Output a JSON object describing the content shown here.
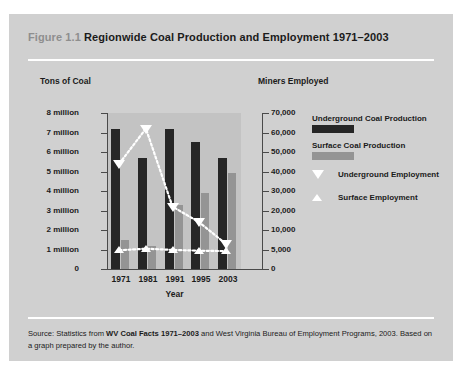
{
  "figure": {
    "label": "Figure 1.1",
    "title": "Regionwide Coal Production and Employment 1971–2003"
  },
  "source": {
    "prefix": "Source: Statistics from ",
    "emphasis": "WV Coal Facts 1971–2003",
    "suffix": " and West Virginia Bureau of Employment Programs, 2003. Based on a graph prepared by the author."
  },
  "colors": {
    "card_background": "#d0d0d0",
    "plot_background": "#c3c3c3",
    "underground_bar": "#262626",
    "surface_bar": "#949494",
    "marker": "#ffffff",
    "axis": "#4a4a4a",
    "rule": "#ffffff",
    "text": "#1b1b1b",
    "label_gray": "#8e8e8e"
  },
  "legend": {
    "items": [
      {
        "name": "underground-coal-production",
        "label": "Underground Coal Production",
        "kind": "swatch",
        "color": "#262626"
      },
      {
        "name": "surface-coal-production",
        "label": "Surface Coal Production",
        "kind": "swatch",
        "color": "#949494"
      },
      {
        "name": "underground-employment",
        "label": "Underground Employment",
        "kind": "marker-down",
        "color": "#ffffff"
      },
      {
        "name": "surface-employment",
        "label": "Surface Employment",
        "kind": "marker-up",
        "color": "#ffffff"
      }
    ]
  },
  "chart_data": {
    "type": "bar",
    "title": "Regionwide Coal Production and Employment 1971–2003",
    "xlabel": "Year",
    "ylabel": "Tons of Coal",
    "y2label": "Miners Employed",
    "grid": false,
    "legend_position": "right",
    "categories": [
      "1971",
      "1981",
      "1991",
      "1995",
      "2003"
    ],
    "ylim": [
      0,
      8000000
    ],
    "yticks": [
      0,
      1000000,
      2000000,
      3000000,
      4000000,
      5000000,
      6000000,
      7000000,
      8000000
    ],
    "ytick_labels": [
      "0",
      "1 million",
      "2 million",
      "3 million",
      "4 million",
      "5 million",
      "6 million",
      "7 million",
      "8 million"
    ],
    "y2ticks": [
      0,
      5000,
      10000,
      20000,
      30000,
      40000,
      50000,
      60000,
      70000
    ],
    "y2tick_labels": [
      "0",
      "5,000",
      "10,000",
      "20,000",
      "30,000",
      "40,000",
      "50,000",
      "60,000",
      "70,000"
    ],
    "y2_scale_note": "Right axis is non-linear: the nine labeled values are spaced evenly and align with the nine left-axis gridlines.",
    "series": [
      {
        "name": "Underground Coal Production",
        "type": "bar",
        "axis": "left",
        "unit": "tons",
        "color": "#262626",
        "values": [
          7200000,
          5700000,
          7200000,
          6500000,
          5700000
        ]
      },
      {
        "name": "Surface Coal Production",
        "type": "bar",
        "axis": "left",
        "unit": "tons",
        "color": "#949494",
        "values": [
          1500000,
          1200000,
          3300000,
          3900000,
          4900000
        ]
      },
      {
        "name": "Underground Employment",
        "type": "line",
        "axis": "right",
        "unit": "miners",
        "marker": "triangle-down",
        "color": "#ffffff",
        "values": [
          44000,
          62000,
          22000,
          14000,
          6500
        ]
      },
      {
        "name": "Surface Employment",
        "type": "line",
        "axis": "right",
        "unit": "miners",
        "marker": "triangle-up",
        "color": "#ffffff",
        "values": [
          4800,
          5200,
          4900,
          4700,
          4600
        ]
      }
    ]
  }
}
